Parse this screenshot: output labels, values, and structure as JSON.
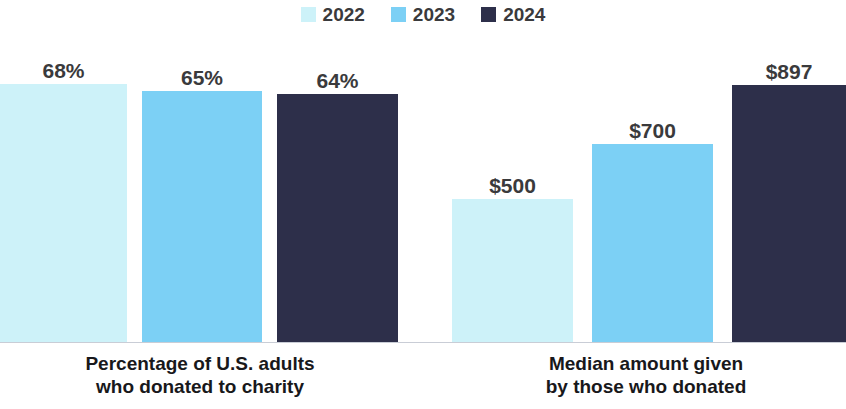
{
  "colors": {
    "series_2022": "#cdf2f9",
    "series_2023": "#7cd0f5",
    "series_2024": "#2d2f4a",
    "value_label": "#3a3a3c",
    "caption": "#18181b",
    "baseline": "#c9cdd6",
    "background": "#ffffff"
  },
  "legend": {
    "items": [
      {
        "label": "2022",
        "color": "#cdf2f9",
        "swatch_name": "legend-swatch-2022"
      },
      {
        "label": "2023",
        "color": "#7cd0f5",
        "swatch_name": "legend-swatch-2023"
      },
      {
        "label": "2024",
        "color": "#2d2f4a",
        "swatch_name": "legend-swatch-2024"
      }
    ]
  },
  "groups": [
    {
      "caption_line1": "Percentage of U.S. adults",
      "caption_line2": "who donated to charity",
      "bars": [
        {
          "series": "2022",
          "label": "68%",
          "value": 68,
          "color": "#cdf2f9",
          "x": 0,
          "width": 127,
          "height": 258
        },
        {
          "series": "2023",
          "label": "65%",
          "value": 65,
          "color": "#7cd0f5",
          "x": 142,
          "width": 120,
          "height": 251
        },
        {
          "series": "2024",
          "label": "64%",
          "value": 64,
          "color": "#2d2f4a",
          "x": 277,
          "width": 121,
          "height": 248
        }
      ]
    },
    {
      "caption_line1": "Median amount given",
      "caption_line2": "by those who donated",
      "bars": [
        {
          "series": "2022",
          "label": "$500",
          "value": 500,
          "color": "#cdf2f9",
          "x": 452,
          "width": 121,
          "height": 143
        },
        {
          "series": "2023",
          "label": "$700",
          "value": 700,
          "color": "#7cd0f5",
          "x": 592,
          "width": 121,
          "height": 198
        },
        {
          "series": "2024",
          "label": "$897",
          "value": 897,
          "color": "#2d2f4a",
          "x": 732,
          "width": 114,
          "height": 257
        }
      ]
    }
  ],
  "chart_data": {
    "type": "bar",
    "title": "",
    "subtitle": "",
    "xlabel": "",
    "ylabel": "",
    "grid": false,
    "legend_position": "top-center",
    "categories": [
      "Percentage of U.S. adults who donated to charity",
      "Median amount given by those who donated"
    ],
    "series": [
      {
        "name": "2022",
        "color": "#cdf2f9",
        "values": [
          68,
          500
        ],
        "labels": [
          "68%",
          "$500"
        ]
      },
      {
        "name": "2023",
        "color": "#7cd0f5",
        "values": [
          65,
          700
        ],
        "labels": [
          "65%",
          "$700"
        ]
      },
      {
        "name": "2024",
        "color": "#2d2f4a",
        "values": [
          64,
          897
        ],
        "labels": [
          "64%",
          "$897"
        ]
      }
    ],
    "panels": [
      {
        "category": "Percentage of U.S. adults who donated to charity",
        "unit": "percent",
        "x": [
          "2022",
          "2023",
          "2024"
        ],
        "y": [
          68,
          65,
          64
        ],
        "data_labels": [
          "68%",
          "65%",
          "64%"
        ],
        "ylim": [
          0,
          90
        ]
      },
      {
        "category": "Median amount given by those who donated",
        "unit": "USD",
        "x": [
          "2022",
          "2023",
          "2024"
        ],
        "y": [
          500,
          700,
          897
        ],
        "data_labels": [
          "$500",
          "$700",
          "$897"
        ],
        "ylim": [
          0,
          1150
        ]
      }
    ],
    "annotations": []
  }
}
